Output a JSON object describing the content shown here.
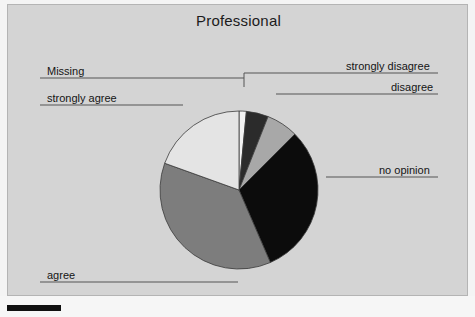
{
  "chart": {
    "title": "Professional",
    "background_color": "#d4d4d4",
    "page_color": "#f4f4f4"
  },
  "labels": {
    "strongly_disagree": "strongly disagree",
    "disagree": "disagree",
    "no_opinion": "no opinion",
    "agree": "agree",
    "strongly_agree": "strongly agree",
    "missing": "Missing"
  },
  "chart_data": {
    "type": "pie",
    "title": "Professional",
    "xlabel": "",
    "ylabel": "",
    "legend_position": "callout-labels",
    "grid": false,
    "start_angle_deg": 0,
    "direction": "clockwise",
    "categories": [
      "Missing",
      "strongly disagree",
      "disagree",
      "no opinion",
      "agree",
      "strongly agree"
    ],
    "values": [
      1.5,
      4.5,
      6.5,
      31.0,
      37.0,
      19.5
    ],
    "units": "percent",
    "colors": [
      "#f2f2f2",
      "#2b2b2b",
      "#a8a8a8",
      "#0c0c0c",
      "#7d7d7d",
      "#e4e4e4"
    ],
    "slices": [
      {
        "label": "Missing",
        "value": 1.5,
        "color": "#f2f2f2"
      },
      {
        "label": "strongly disagree",
        "value": 4.5,
        "color": "#2b2b2b"
      },
      {
        "label": "disagree",
        "value": 6.5,
        "color": "#a8a8a8"
      },
      {
        "label": "no opinion",
        "value": 31.0,
        "color": "#0c0c0c"
      },
      {
        "label": "agree",
        "value": 37.0,
        "color": "#7d7d7d"
      },
      {
        "label": "strongly agree",
        "value": 19.5,
        "color": "#e4e4e4"
      }
    ]
  }
}
